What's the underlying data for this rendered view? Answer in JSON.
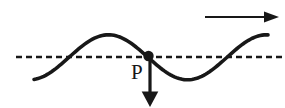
{
  "diagram": {
    "point_label": "P",
    "background": "#ffffff",
    "stroke_color": "#181818",
    "midline": {
      "y": 57,
      "x1": 16,
      "x2": 283,
      "dash": "6 4",
      "width": 2.3
    },
    "wave": {
      "x_start": 34,
      "x_end": 268,
      "mid_y": 57.3,
      "amplitude": 22.5,
      "wavelength": 158,
      "zero_crossing_up_x": 69,
      "stroke_width": 3.6
    },
    "point": {
      "x": 148.5,
      "y": 56,
      "radius": 5.2
    },
    "down_arrow": {
      "x": 150,
      "y_start": 58,
      "y_tip": 107,
      "head_length": 15.5,
      "head_half_width": 8.3,
      "shaft_width": 3.2
    },
    "right_arrow": {
      "y": 17,
      "x_start": 205,
      "x_tip": 279,
      "head_length": 15,
      "head_half_width": 5.5,
      "shaft_width": 2.2
    },
    "label_pos": {
      "x": 131,
      "y": 79,
      "font_size": 21
    }
  }
}
